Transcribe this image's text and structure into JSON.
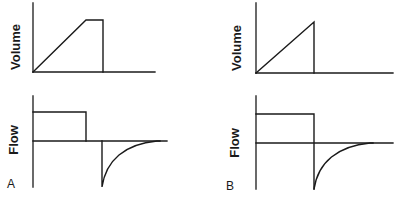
{
  "figure": {
    "panels": [
      {
        "letter": "A",
        "volume_label": "Volume",
        "flow_label": "Flow",
        "description": "Volume rises linearly, plateaus (inspiratory pause), then returns; flow is a square wave that stops before exhalation, followed by a negative exponential expiratory flow."
      },
      {
        "letter": "B",
        "volume_label": "Volume",
        "flow_label": "Flow",
        "description": "Volume rises linearly to peak and immediately returns; square-wave inspiratory flow is followed immediately by negative exponential expiratory flow."
      }
    ]
  },
  "colors": {
    "line": "#1a1a1a",
    "background": "#ffffff"
  }
}
